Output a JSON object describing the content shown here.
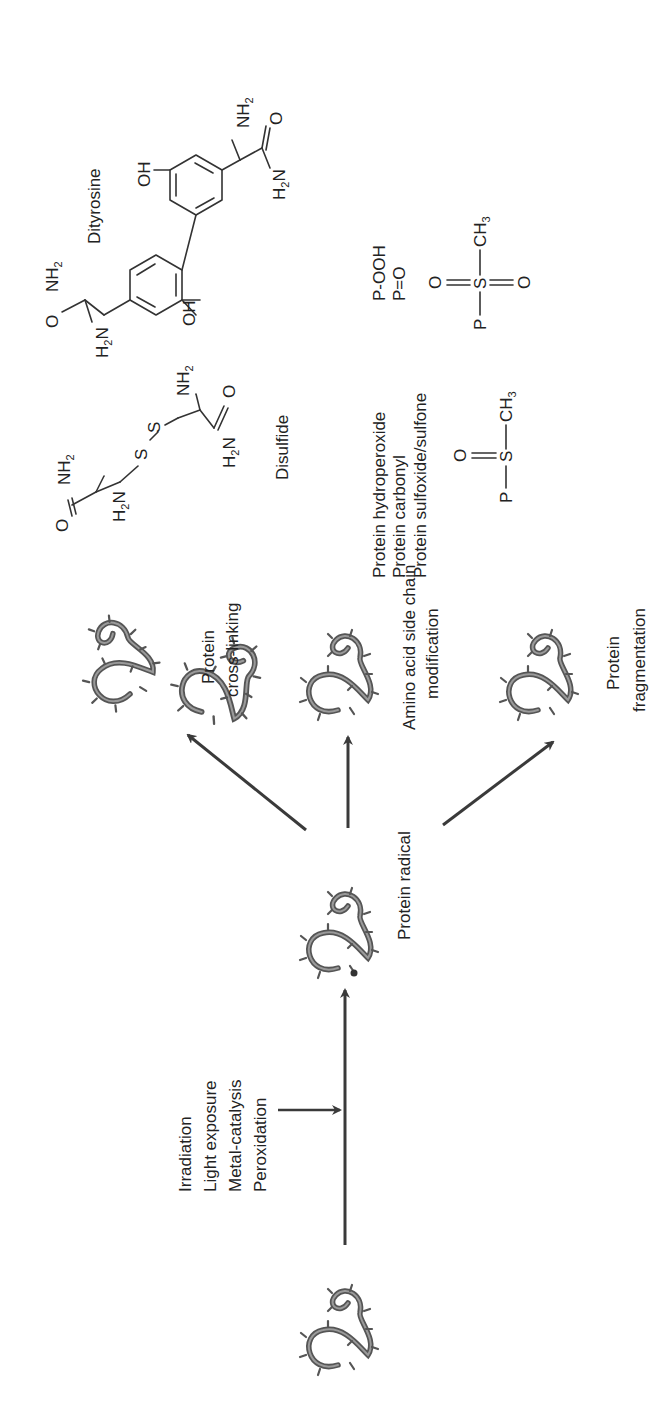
{
  "figure": {
    "orientation": "rotated-90-ccw",
    "background": "#ffffff",
    "ink_color": "#333333"
  },
  "pathway": {
    "stimuli": [
      "Irradiation",
      "Light exposure",
      "Metal-catalysis",
      "Peroxidation"
    ],
    "intermediate_label": "Protein radical",
    "products": [
      {
        "label_lines": [
          "Protein",
          "cross-linking"
        ]
      },
      {
        "label_lines": [
          "Amino acid side chain",
          "modification"
        ]
      },
      {
        "label_lines": [
          "Protein",
          "fragmentation"
        ]
      }
    ]
  },
  "structures": {
    "dityrosine": {
      "name": "Dityrosine",
      "groups": {
        "nh2": "NH",
        "h2n": "H",
        "n": "N",
        "oh": "OH",
        "o": "O",
        "sub2": "2"
      }
    },
    "disulfide": {
      "name": "Disulfide",
      "atoms": {
        "s": "S",
        "o": "O",
        "nh": "NH",
        "h": "H",
        "n": "N",
        "sub2": "2"
      }
    },
    "oxidation_products": {
      "names": [
        "Protein hydroperoxide",
        "Protein carbonyl",
        "Protein sulfoxide/sulfone"
      ],
      "abbreviations": [
        "P-OOH",
        "P=O"
      ],
      "sulfoxide": {
        "p": "P",
        "s": "S",
        "o": "O",
        "ch": "CH",
        "sub3": "3"
      },
      "sulfone": {
        "p": "P",
        "s": "S",
        "o": "O",
        "ch": "CH",
        "sub3": "3"
      }
    }
  }
}
